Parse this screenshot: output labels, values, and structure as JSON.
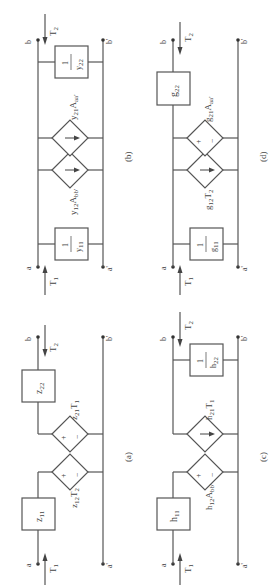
{
  "figure": {
    "orientation": "rotated-90-ccw",
    "panels": [
      {
        "id": "a",
        "caption": "(a)",
        "type": "z-parameter",
        "input_element": {
          "kind": "impedance-box",
          "label": "z",
          "sub": "11"
        },
        "input_source": {
          "kind": "voltage-source",
          "label": "z",
          "sub": "12",
          "var": "T",
          "var_sub": "2",
          "signs": [
            "+",
            "−"
          ]
        },
        "output_source": {
          "kind": "voltage-source",
          "label": "z",
          "sub": "21",
          "var": "T",
          "var_sub": "1",
          "signs": [
            "+",
            "−"
          ]
        },
        "output_element": {
          "kind": "impedance-box",
          "label": "z",
          "sub": "22"
        },
        "terminals": {
          "in_top": "a",
          "in_bottom": "a'",
          "out_top": "b",
          "out_bottom": "b'"
        },
        "arrows": {
          "in": "T",
          "in_sub": "1",
          "out": "T",
          "out_sub": "2"
        }
      },
      {
        "id": "b",
        "caption": "(b)",
        "type": "y-parameter",
        "input_element": {
          "kind": "admittance-box",
          "num": "1",
          "den": "y",
          "den_sub": "11"
        },
        "input_source": {
          "kind": "current-source",
          "label": "y",
          "sub": "12",
          "var": "A",
          "var_sub": "bb'"
        },
        "output_source": {
          "kind": "current-source",
          "label": "y",
          "sub": "21",
          "var": "A",
          "var_sub": "aa'"
        },
        "output_element": {
          "kind": "admittance-box",
          "num": "1",
          "den": "y",
          "den_sub": "22"
        },
        "terminals": {
          "in_top": "a",
          "in_bottom": "a'",
          "out_top": "b",
          "out_bottom": "b'"
        },
        "arrows": {
          "in": "T",
          "in_sub": "1",
          "out": "T",
          "out_sub": "2"
        }
      },
      {
        "id": "c",
        "caption": "(c)",
        "type": "h-parameter",
        "input_element": {
          "kind": "impedance-box",
          "label": "h",
          "sub": "11"
        },
        "input_source": {
          "kind": "voltage-source",
          "label": "h",
          "sub": "12",
          "var": "A",
          "var_sub": "bb'",
          "signs": [
            "+",
            "−"
          ]
        },
        "output_source": {
          "kind": "current-source",
          "label": "h",
          "sub": "21",
          "var": "T",
          "var_sub": "1"
        },
        "output_element": {
          "kind": "admittance-box",
          "num": "1",
          "den": "h",
          "den_sub": "22"
        },
        "terminals": {
          "in_top": "a",
          "in_bottom": "a'",
          "out_top": "b",
          "out_bottom": "b'"
        },
        "arrows": {
          "in": "T",
          "in_sub": "1",
          "out": "T",
          "out_sub": "2"
        }
      },
      {
        "id": "d",
        "caption": "(d)",
        "type": "g-parameter",
        "input_element": {
          "kind": "admittance-box",
          "num": "1",
          "den": "g",
          "den_sub": "11"
        },
        "input_source": {
          "kind": "current-source",
          "label": "g",
          "sub": "12",
          "var": "T",
          "var_sub": "2"
        },
        "output_source": {
          "kind": "voltage-source",
          "label": "g",
          "sub": "21",
          "var": "A",
          "var_sub": "aa'",
          "signs": [
            "+",
            "−"
          ]
        },
        "output_element": {
          "kind": "impedance-box",
          "label": "g",
          "sub": "22"
        },
        "terminals": {
          "in_top": "a",
          "in_bottom": "a'",
          "out_top": "b",
          "out_bottom": "b'"
        },
        "arrows": {
          "in": "T",
          "in_sub": "1",
          "out": "T",
          "out_sub": "2"
        }
      }
    ]
  },
  "colors": {
    "line": "#555555",
    "text": "#444444",
    "background": "#ffffff"
  }
}
